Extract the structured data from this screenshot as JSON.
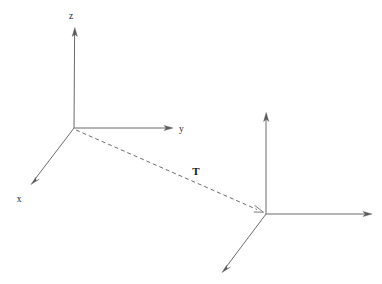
{
  "figure": {
    "kind": "coordinate-frame-transformation-diagram",
    "width": 382,
    "height": 284,
    "background_color": "#ffffff",
    "stroke_color": "#6b6b6b",
    "label_color": "#2a2a2a"
  },
  "frame_a": {
    "name": "reference-frame",
    "origin": {
      "x": 74,
      "y": 128
    },
    "axes": [
      {
        "id": "z",
        "label": "z",
        "label_position": {
          "x": 71,
          "y": 19
        },
        "from": {
          "x": 74,
          "y": 128
        },
        "to": {
          "x": 75,
          "y": 28
        },
        "direction": "up"
      },
      {
        "id": "y",
        "label": "y",
        "label_position": {
          "x": 179,
          "y": 132
        },
        "from": {
          "x": 74,
          "y": 128
        },
        "to": {
          "x": 173,
          "y": 128
        },
        "direction": "right"
      },
      {
        "id": "x",
        "label": "x",
        "label_position": {
          "x": 19,
          "y": 202
        },
        "from": {
          "x": 74,
          "y": 128
        },
        "to": {
          "x": 31,
          "y": 184
        },
        "direction": "down-left"
      }
    ]
  },
  "frame_b": {
    "name": "transformed-frame",
    "origin": {
      "x": 266,
      "y": 214
    },
    "axes": [
      {
        "id": "z-prime",
        "label": "",
        "from": {
          "x": 266,
          "y": 214
        },
        "to": {
          "x": 266,
          "y": 113
        },
        "direction": "up"
      },
      {
        "id": "y-prime",
        "label": "",
        "from": {
          "x": 266,
          "y": 214
        },
        "to": {
          "x": 372,
          "y": 214
        },
        "direction": "right"
      },
      {
        "id": "x-prime",
        "label": "",
        "from": {
          "x": 266,
          "y": 214
        },
        "to": {
          "x": 222,
          "y": 272
        },
        "direction": "down-left"
      }
    ]
  },
  "translation_vector": {
    "label": "T",
    "label_position": {
      "x": 196,
      "y": 175
    },
    "style": "dashed",
    "from": {
      "x": 76,
      "y": 130
    },
    "to": {
      "x": 263,
      "y": 212
    },
    "has_arrowhead": true,
    "arrowhead_style": "open"
  }
}
